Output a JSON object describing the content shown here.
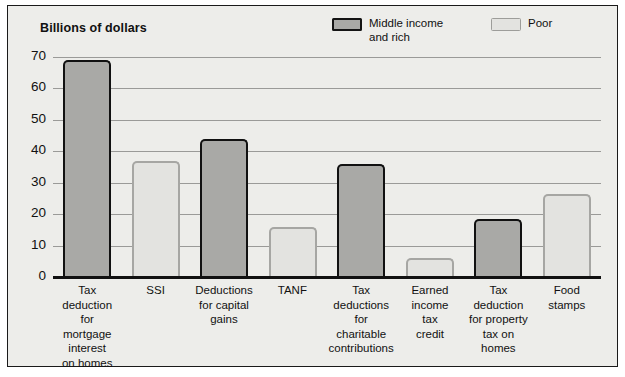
{
  "chart_data": {
    "type": "bar",
    "title": "Billions of dollars",
    "xlabel": "",
    "ylabel": "Billions of dollars",
    "ylim": [
      0,
      70
    ],
    "yticks": [
      0,
      10,
      20,
      30,
      40,
      50,
      60,
      70
    ],
    "grid": true,
    "legend_position": "top-right",
    "categories": [
      "Tax deduction for mortgage interest on homes",
      "SSI",
      "Deductions for capital gains",
      "TANF",
      "Tax deductions for charitable contributions",
      "Earned income tax credit",
      "Tax deduction for property tax on homes",
      "Food stamps"
    ],
    "category_lines": [
      [
        "Tax",
        "deduction",
        "for mortgage",
        "interest",
        "on homes"
      ],
      [
        "SSI"
      ],
      [
        "Deductions",
        "for capital",
        "gains"
      ],
      [
        "TANF"
      ],
      [
        "Tax",
        "deductions",
        "for",
        "charitable",
        "contributions"
      ],
      [
        "Earned",
        "income",
        "tax",
        "credit"
      ],
      [
        "Tax",
        "deduction",
        "for property",
        "tax on",
        "homes"
      ],
      [
        "Food",
        "stamps"
      ]
    ],
    "values": [
      69,
      37,
      44,
      16,
      36,
      6,
      18.5,
      26.5
    ],
    "groups": [
      "Middle income and rich",
      "Poor",
      "Middle income and rich",
      "Poor",
      "Middle income and rich",
      "Poor",
      "Middle income and rich",
      "Poor"
    ],
    "series": [
      {
        "name": "Middle income and rich",
        "color": "#a9a9a6",
        "border_color": "#111111",
        "points": [
          {
            "category": "Tax deduction for mortgage interest on homes",
            "value": 69
          },
          {
            "category": "Deductions for capital gains",
            "value": 44
          },
          {
            "category": "Tax deductions for charitable contributions",
            "value": 36
          },
          {
            "category": "Tax deduction for property tax on homes",
            "value": 18.5
          }
        ]
      },
      {
        "name": "Poor",
        "color": "#e3e3e0",
        "border_color": "#a6a6a3",
        "points": [
          {
            "category": "SSI",
            "value": 37
          },
          {
            "category": "TANF",
            "value": 16
          },
          {
            "category": "Earned income tax credit",
            "value": 6
          },
          {
            "category": "Food stamps",
            "value": 26.5
          }
        ]
      }
    ]
  },
  "legend": {
    "items": [
      {
        "label": "Middle income and rich",
        "style": "dark"
      },
      {
        "label": "Poor",
        "style": "light"
      }
    ]
  },
  "colors": {
    "background": "#ededea",
    "frame_border": "#1a1a1a",
    "gridline": "#9a9a98",
    "baseline": "#111111",
    "dark_bar_fill": "#a9a9a6",
    "dark_bar_border": "#111111",
    "light_bar_fill": "#e3e3e0",
    "light_bar_border": "#a6a6a3",
    "text": "#111111"
  }
}
